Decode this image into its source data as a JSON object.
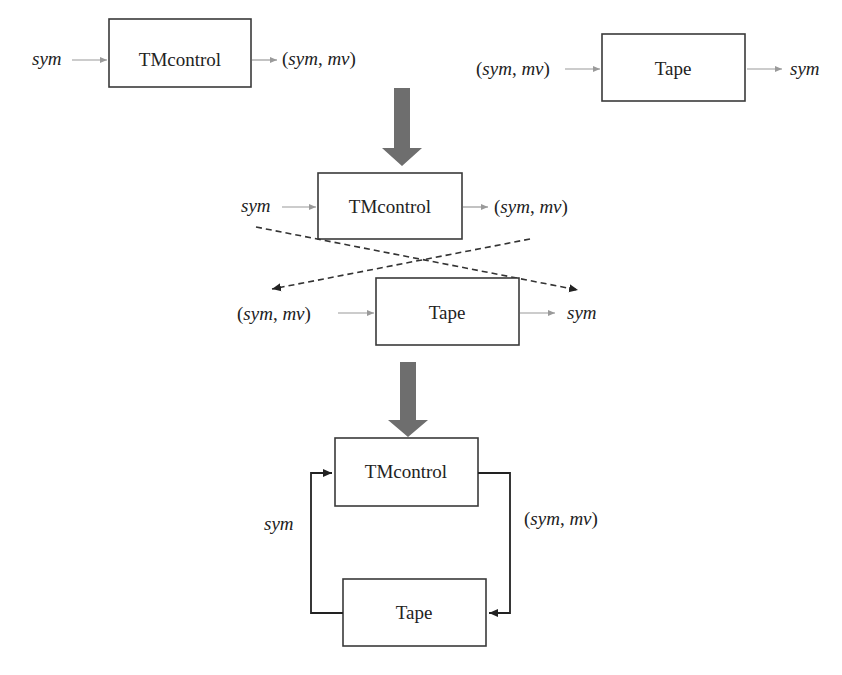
{
  "diagram": {
    "stage1": {
      "tmcontrol": {
        "label": "TMcontrol",
        "input": "sym",
        "output": "(sym, mv)"
      },
      "tape": {
        "label": "Tape",
        "input": "(sym, mv)",
        "output": "sym"
      }
    },
    "stage2": {
      "tmcontrol": {
        "label": "TMcontrol",
        "input": "sym",
        "output": "(sym, mv)"
      },
      "tape": {
        "label": "Tape",
        "input": "(sym, mv)",
        "output": "sym"
      },
      "cross_connections": "dashed crossing arrows"
    },
    "stage3": {
      "tmcontrol": {
        "label": "TMcontrol"
      },
      "tape": {
        "label": "Tape"
      },
      "feedback_left": "sym",
      "feedback_right": "(sym, mv)"
    },
    "colors": {
      "box_stroke": "#3a3a3a",
      "big_arrow": "#6e6e6e",
      "thin_arrow": "#9a9a9a",
      "dashed": "#333333"
    }
  }
}
